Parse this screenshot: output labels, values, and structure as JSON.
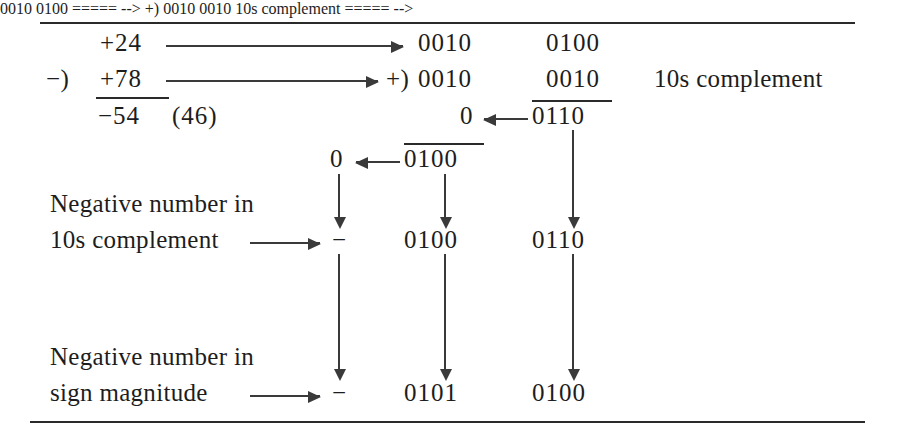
{
  "figure": {
    "title_text": "",
    "decimal_problem": {
      "minuend": "+24",
      "subtract_op": "−)",
      "subtrahend": "+78",
      "result": "−54",
      "result_alt": "(46)"
    },
    "binary_problem": {
      "add_op": "+)",
      "row1_col1": "0010",
      "row1_col2": "0100",
      "row2_col1": "0010",
      "row2_col2": "0010",
      "note": "10s complement",
      "row3_carry": "0",
      "row3_sum": "0110",
      "row4_carry": "0",
      "row4_sum": "0100"
    },
    "tens_complement_row": {
      "label_line1": "Negative number in",
      "label_line2": "10s complement",
      "sign": "−",
      "digit1": "0100",
      "digit2": "0110"
    },
    "sign_magnitude_row": {
      "label_line1": "Negative number in",
      "label_line2": "sign magnitude",
      "sign": "−",
      "digit1": "0101",
      "digit2": "0100"
    },
    "icons": {
      "arrow_right": "arrow-right-icon",
      "arrow_left": "arrow-left-icon",
      "arrow_down": "arrow-down-icon"
    },
    "colors": {
      "ink": "#1d1d1d",
      "rule": "#2a2a2a",
      "paper": "#ffffff"
    }
  }
}
